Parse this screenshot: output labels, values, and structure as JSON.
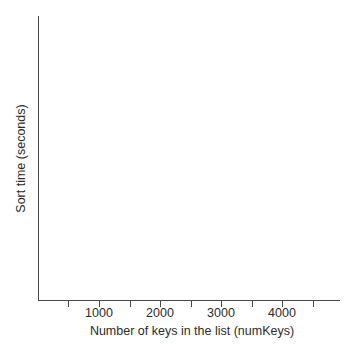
{
  "chart_data": {
    "type": "line",
    "title": "",
    "xlabel": "Number of keys in the list (numKeys)",
    "ylabel": "Sort time (seconds)",
    "xlim": [
      0,
      4900
    ],
    "ylim": [
      0,
      1
    ],
    "grid": false,
    "legend": null,
    "series": [],
    "values": [],
    "x": [],
    "xticks": [
      {
        "value": 500,
        "label": "",
        "px": 68
      },
      {
        "value": 1000,
        "label": "1000",
        "px": 99
      },
      {
        "value": 1500,
        "label": "",
        "px": 130
      },
      {
        "value": 2000,
        "label": "2000",
        "px": 160
      },
      {
        "value": 2500,
        "label": "",
        "px": 191
      },
      {
        "value": 3000,
        "label": "3000",
        "px": 221
      },
      {
        "value": 3500,
        "label": "",
        "px": 252
      },
      {
        "value": 4000,
        "label": "4000",
        "px": 282
      },
      {
        "value": 4500,
        "label": "",
        "px": 313
      }
    ],
    "yticks": []
  },
  "axes": {
    "x_tick_labels": [
      "1000",
      "2000",
      "3000",
      "4000"
    ],
    "x_axis_title": "Number of keys in the list (numKeys)",
    "y_axis_title": "Sort time (seconds)"
  },
  "colors": {
    "background": "#ffffff",
    "axis_line": "#4a4a4a",
    "text": "#2b2b2b"
  }
}
